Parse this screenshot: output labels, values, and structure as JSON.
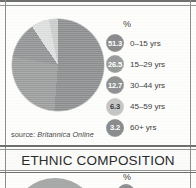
{
  "document": {
    "kind": "almanac-infographic",
    "source_note": {
      "label": "source:",
      "name": "Britannica Online"
    }
  },
  "age_section": {
    "percent_header": "%",
    "legend": [
      {
        "value": "51.3",
        "label": "0–15 yrs",
        "color": "#8a8c8d",
        "text_tone": "dark"
      },
      {
        "value": "26.5",
        "label": "15–29 yrs",
        "color": "#9a9c9c",
        "text_tone": "dark"
      },
      {
        "value": "12.7",
        "label": "30–44 yrs",
        "color": "#909293",
        "text_tone": "dark"
      },
      {
        "value": "6.3",
        "label": "45–59 yrs",
        "color": "#c5c7c6",
        "text_tone": "light"
      },
      {
        "value": "3.2",
        "label": "60+ yrs",
        "color": "#8a8c8d",
        "text_tone": "dark"
      }
    ]
  },
  "ethnic_section": {
    "title": "ETHNIC COMPOSITION",
    "percent_header": "%",
    "first_value": "33"
  },
  "chart_data": {
    "type": "pie",
    "unit": "%",
    "categories": [
      "0–15 yrs",
      "15–29 yrs",
      "30–44 yrs",
      "45–59 yrs",
      "60+ yrs"
    ],
    "values": [
      51.3,
      26.5,
      12.7,
      6.3,
      3.2
    ],
    "colors": [
      "#8a8c8d",
      "#9a9c9c",
      "#909293",
      "#dcdedd",
      "#c9cbca"
    ],
    "legend_position": "right",
    "grid": false,
    "source": "Britannica Online"
  },
  "palette": {
    "rule": "#6f7170",
    "paper": "#fdfdfc",
    "ink": "#2b2b2b"
  }
}
